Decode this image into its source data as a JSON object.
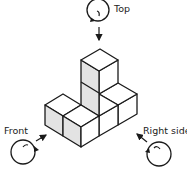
{
  "figure": {
    "type": "isometric-cube-views",
    "labels": {
      "top": "Top",
      "front": "Front",
      "right": "Right side"
    },
    "colors": {
      "stroke": "#1a1a1a",
      "shaded_face": "#e3e3e3",
      "face": "#ffffff",
      "text": "#222222"
    },
    "cube_count": 6,
    "viewpoints": [
      "top",
      "front",
      "right-side"
    ]
  }
}
